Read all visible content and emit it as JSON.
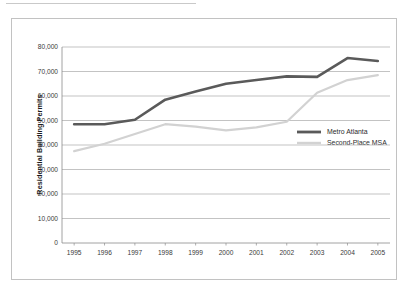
{
  "chart_data": {
    "type": "line",
    "title": "",
    "subtitle": "",
    "xlabel": "",
    "ylabel": "Residential Building Permits",
    "x": [
      1995,
      1996,
      1997,
      1998,
      1999,
      2000,
      2001,
      2002,
      2003,
      2004,
      2005
    ],
    "categories": [
      "1995",
      "1996",
      "1997",
      "1998",
      "1999",
      "2000",
      "2001",
      "2002",
      "2003",
      "2004",
      "2005"
    ],
    "xlim": [
      1994.6,
      2005.4
    ],
    "ylim": [
      0,
      80000
    ],
    "yticks": [
      0,
      10000,
      20000,
      30000,
      40000,
      50000,
      60000,
      70000,
      80000
    ],
    "ytick_labels": [
      "0",
      "10,000",
      "20,000",
      "30,000",
      "40,000",
      "50,000",
      "60,000",
      "70,000",
      "80,000"
    ],
    "grid": "horizontal",
    "legend_position": "right-middle",
    "series": [
      {
        "name": "Metro Atlanta",
        "color": "#5a5a5a",
        "line_width": 2.6,
        "values": [
          48500,
          48500,
          50300,
          58500,
          61800,
          65000,
          66500,
          68000,
          67800,
          75500,
          74300
        ]
      },
      {
        "name": "Second-Place MSA",
        "color": "#d2d2d2",
        "line_width": 2.2,
        "values": [
          37500,
          40500,
          44500,
          48500,
          47500,
          46000,
          47200,
          49500,
          61300,
          66500,
          68500
        ]
      }
    ]
  },
  "axes": {
    "y_title": "Residential Building Permits",
    "y_tick_labels": [
      "80,000",
      "70,000",
      "60,000",
      "50,000",
      "40,000",
      "30,000",
      "20,000",
      "10,000",
      "0"
    ],
    "x_tick_labels": [
      "1995",
      "1996",
      "1997",
      "1998",
      "1999",
      "2000",
      "2001",
      "2002",
      "2003",
      "2004",
      "2005"
    ]
  },
  "legend": {
    "items": [
      {
        "label": "Metro Atlanta",
        "color": "#5a5a5a"
      },
      {
        "label": "Second-Place MSA",
        "color": "#d2d2d2"
      }
    ]
  },
  "colors": {
    "metro_atlanta": "#5a5a5a",
    "second_place_msa": "#d2d2d2",
    "gridline": "#a9a9a9",
    "axis": "#8c8c8c",
    "border": "#c2c2c2",
    "text": "#3a3a3a"
  }
}
